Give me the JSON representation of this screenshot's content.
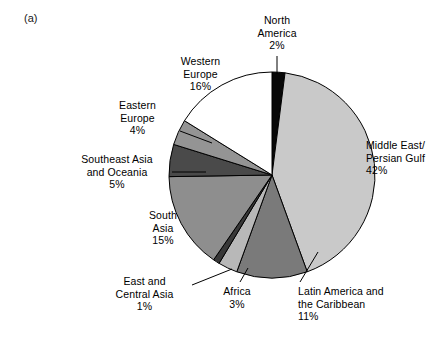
{
  "figure": {
    "panel_label": "(a)"
  },
  "chart_data": {
    "type": "pie",
    "title": "",
    "subtitle": "",
    "xlabel": "",
    "ylabel": "",
    "legend_position": "none",
    "grid": false,
    "value_unit": "%",
    "start_angle_deg": 0,
    "direction": "clockwise",
    "categories": [
      "North America",
      "Middle East/\nPersian Gulf",
      "Latin America and\nthe Caribbean",
      "Africa",
      "East and\nCentral Asia",
      "South\nAsia",
      "Southeast Asia\nand Oceania",
      "Eastern\nEurope",
      "Western\nEurope"
    ],
    "values": [
      2,
      42,
      11,
      3,
      1,
      15,
      5,
      4,
      16
    ],
    "colors": [
      "#080808",
      "#c9c9c9",
      "#7a7a7a",
      "#b8b8b8",
      "#383838",
      "#8e8e8e",
      "#4a4a4a",
      "#949494",
      "#ffffff"
    ],
    "slices": [
      {
        "name": "North America",
        "label_text": "North\nAmerica",
        "value_text": "2%",
        "value": 2,
        "color": "#080808",
        "label_x": 242,
        "label_y": 14,
        "label_align": "center",
        "label_width": 70,
        "leader": [
          [
            277,
            56
          ],
          [
            277,
            74
          ]
        ]
      },
      {
        "name": "Middle East/Persian Gulf",
        "label_text": "Middle East/\nPersian Gulf",
        "value_text": "42%",
        "value": 42,
        "color": "#c9c9c9",
        "label_x": 366,
        "label_y": 139,
        "label_align": "left",
        "label_width": 80,
        "leader": null
      },
      {
        "name": "Latin America and the Caribbean",
        "label_text": "Latin America and\nthe Caribbean",
        "value_text": "11%",
        "value": 11,
        "color": "#7a7a7a",
        "label_x": 298,
        "label_y": 285,
        "label_align": "left",
        "label_width": 110,
        "leader": [
          [
            318,
            252
          ],
          [
            300,
            282
          ]
        ]
      },
      {
        "name": "Africa",
        "label_text": "Africa",
        "value_text": "3%",
        "value": 3,
        "color": "#b8b8b8",
        "label_x": 212,
        "label_y": 285,
        "label_align": "center",
        "label_width": 50,
        "leader": [
          [
            248,
            268
          ],
          [
            240,
            282
          ]
        ]
      },
      {
        "name": "East and Central Asia",
        "label_text": "East and\nCentral Asia",
        "value_text": "1%",
        "value": 1,
        "color": "#383838",
        "label_x": 102,
        "label_y": 275,
        "label_align": "center",
        "label_width": 85,
        "leader": [
          [
            232,
            269
          ],
          [
            192,
            285
          ]
        ]
      },
      {
        "name": "South Asia",
        "label_text": "South\nAsia",
        "value_text": "15%",
        "value": 15,
        "color": "#8e8e8e",
        "label_x": 133,
        "label_y": 209,
        "label_align": "center",
        "label_width": 60,
        "leader": null
      },
      {
        "name": "Southeast Asia and Oceania",
        "label_text": "Southeast Asia\nand Oceania",
        "value_text": "5%",
        "value": 5,
        "color": "#4a4a4a",
        "label_x": 67,
        "label_y": 153,
        "label_align": "center",
        "label_width": 100,
        "leader": [
          [
            172,
            172
          ],
          [
            206,
            172
          ]
        ]
      },
      {
        "name": "Eastern Europe",
        "label_text": "Eastern\nEurope",
        "value_text": "4%",
        "value": 4,
        "color": "#949494",
        "label_x": 100,
        "label_y": 99,
        "label_align": "center",
        "label_width": 75,
        "leader": [
          [
            180,
            131
          ],
          [
            212,
            143
          ]
        ]
      },
      {
        "name": "Western Europe",
        "label_text": "Western\nEurope",
        "value_text": "16%",
        "value": 16,
        "color": "#ffffff",
        "label_x": 163,
        "label_y": 55,
        "label_align": "center",
        "label_width": 75,
        "leader": null
      }
    ],
    "geometry": {
      "center_x": 272,
      "center_y": 175,
      "radius": 103
    }
  }
}
